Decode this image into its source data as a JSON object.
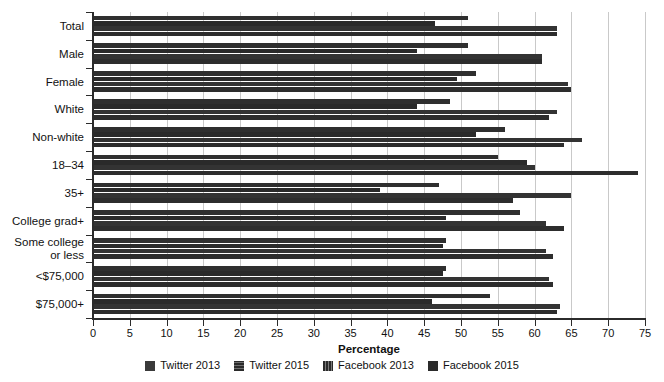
{
  "chart_data": {
    "type": "bar",
    "orientation": "horizontal",
    "title": "",
    "xlabel": "Percentage",
    "ylabel": "",
    "xlim": [
      0,
      75
    ],
    "xticks": [
      0,
      5,
      10,
      15,
      20,
      25,
      30,
      35,
      40,
      45,
      50,
      55,
      60,
      65,
      70,
      75
    ],
    "grid": true,
    "legend_position": "bottom",
    "categories": [
      "Total",
      "Male",
      "Female",
      "White",
      "Non-white",
      "18–34",
      "35+",
      "College grad+",
      "Some college\nor less",
      "<$75,000",
      "$75,000+"
    ],
    "series": [
      {
        "name": "Twitter 2013",
        "values": [
          51,
          51,
          52,
          48.5,
          56,
          55,
          47,
          58,
          48,
          48,
          54
        ]
      },
      {
        "name": "Twitter 2015",
        "values": [
          46.5,
          44,
          49.5,
          44,
          52,
          59,
          39,
          48,
          47.5,
          47.5,
          46
        ]
      },
      {
        "name": "Facebook 2013",
        "values": [
          63,
          61,
          64.5,
          63,
          66.5,
          60,
          65,
          61.5,
          61.5,
          62,
          63.5
        ]
      },
      {
        "name": "Facebook 2015",
        "values": [
          63,
          61,
          65,
          62,
          64,
          74,
          57,
          64,
          62.5,
          62.5,
          63
        ]
      }
    ]
  },
  "legend": {
    "items": [
      {
        "label": "Twitter 2013"
      },
      {
        "label": "Twitter 2015"
      },
      {
        "label": "Facebook 2013"
      },
      {
        "label": "Facebook 2015"
      }
    ]
  },
  "axis": {
    "x_title": "Percentage"
  },
  "colors": {
    "bar": "#2e2e2e",
    "grid": "#c9c9c9",
    "axis": "#2b2b2b",
    "background": "#ffffff"
  }
}
